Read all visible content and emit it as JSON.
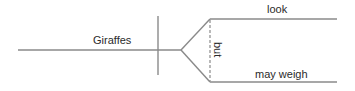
{
  "diagram": {
    "type": "sentence-diagram",
    "subject": "Giraffes",
    "conjunction": "but",
    "predicates": [
      {
        "label": "look"
      },
      {
        "label": "may weigh"
      }
    ],
    "colors": {
      "line": "#8a8a8a",
      "text": "#2a2a2a",
      "background": "#ffffff"
    }
  }
}
